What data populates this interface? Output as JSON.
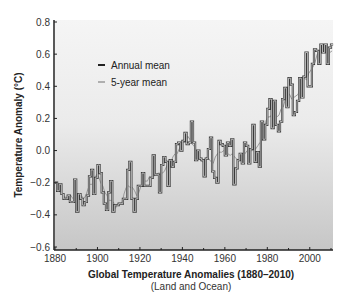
{
  "chart_data": {
    "type": "line",
    "title": "Global Temperature Anomalies (1880–2010)",
    "subtitle": "(Land and Ocean)",
    "xlabel": "Global Temperature Anomalies (1880–2010)",
    "ylabel": "Temperature Anomaly (°C)",
    "xlim": [
      1880,
      2010
    ],
    "ylim": [
      -0.6,
      0.8
    ],
    "x_ticks": [
      1880,
      1900,
      1920,
      1940,
      1960,
      1980,
      2000
    ],
    "x_minor_ticks": [
      1890,
      1910,
      1930,
      1950,
      1970,
      1990,
      2010
    ],
    "y_ticks": [
      -0.6,
      -0.4,
      -0.2,
      0.0,
      0.2,
      0.4,
      0.6,
      0.8
    ],
    "y_tick_labels": [
      "−0.6",
      "−0.4",
      "−0.2",
      "0.0",
      "0.2",
      "0.4",
      "0.6",
      "0.8"
    ],
    "grid": false,
    "legend_position": "upper-left",
    "legend": [
      "Annual mean",
      "5-year mean"
    ],
    "x_start": 1880,
    "series": [
      {
        "name": "Annual mean",
        "style": "step",
        "color": "#3a3a3a",
        "values": [
          -0.2,
          -0.25,
          -0.21,
          -0.27,
          -0.3,
          -0.3,
          -0.28,
          -0.32,
          -0.32,
          -0.18,
          -0.38,
          -0.27,
          -0.3,
          -0.34,
          -0.32,
          -0.28,
          -0.16,
          -0.12,
          -0.27,
          -0.17,
          -0.09,
          -0.14,
          -0.26,
          -0.33,
          -0.37,
          -0.26,
          -0.19,
          -0.38,
          -0.34,
          -0.34,
          -0.33,
          -0.33,
          -0.3,
          -0.3,
          -0.12,
          -0.07,
          -0.3,
          -0.38,
          -0.3,
          -0.22,
          -0.22,
          -0.14,
          -0.22,
          -0.22,
          -0.22,
          -0.17,
          -0.03,
          -0.15,
          -0.15,
          -0.26,
          -0.09,
          -0.04,
          -0.07,
          -0.22,
          -0.06,
          -0.1,
          -0.07,
          0.04,
          0.05,
          0.0,
          0.06,
          0.11,
          0.04,
          0.05,
          0.18,
          0.05,
          -0.06,
          0.0,
          -0.05,
          -0.06,
          -0.16,
          -0.05,
          0.01,
          0.08,
          -0.13,
          -0.17,
          -0.2,
          0.06,
          0.04,
          0.03,
          -0.03,
          0.05,
          0.03,
          0.07,
          -0.21,
          -0.11,
          -0.06,
          -0.02,
          -0.08,
          0.05,
          0.03,
          -0.08,
          0.01,
          0.16,
          -0.07,
          -0.01,
          -0.1,
          0.18,
          0.07,
          0.16,
          0.26,
          0.32,
          0.14,
          0.31,
          0.16,
          0.12,
          0.18,
          0.32,
          0.39,
          0.27,
          0.45,
          0.41,
          0.22,
          0.24,
          0.31,
          0.45,
          0.33,
          0.46,
          0.61,
          0.4,
          0.4,
          0.54,
          0.63,
          0.62,
          0.54,
          0.68,
          0.61,
          0.66,
          0.54,
          0.64,
          0.71
        ],
        "values_note": "Estimated from pixel positions; the rendered plot clips at the visible maximum (~0.64)."
      },
      {
        "name": "5-year mean",
        "style": "line",
        "color": "#9a9a9a",
        "values": [
          -0.23,
          -0.24,
          -0.26,
          -0.27,
          -0.29,
          -0.29,
          -0.3,
          -0.28,
          -0.3,
          -0.3,
          -0.29,
          -0.3,
          -0.28,
          -0.3,
          -0.28,
          -0.24,
          -0.21,
          -0.21,
          -0.19,
          -0.15,
          -0.16,
          -0.2,
          -0.22,
          -0.26,
          -0.28,
          -0.31,
          -0.31,
          -0.32,
          -0.36,
          -0.33,
          -0.33,
          -0.33,
          -0.27,
          -0.23,
          -0.22,
          -0.23,
          -0.23,
          -0.25,
          -0.28,
          -0.26,
          -0.22,
          -0.2,
          -0.19,
          -0.19,
          -0.16,
          -0.17,
          -0.16,
          -0.15,
          -0.14,
          -0.14,
          -0.14,
          -0.13,
          -0.1,
          -0.08,
          -0.08,
          -0.04,
          -0.02,
          -0.02,
          0.01,
          0.04,
          0.05,
          0.05,
          0.09,
          0.07,
          0.04,
          0.03,
          -0.01,
          -0.02,
          -0.06,
          -0.07,
          -0.06,
          -0.04,
          -0.05,
          -0.07,
          -0.08,
          -0.04,
          -0.02,
          -0.01,
          -0.01,
          0.0,
          -0.02,
          -0.02,
          -0.03,
          -0.02,
          -0.04,
          -0.05,
          -0.06,
          -0.04,
          -0.02,
          -0.02,
          0.0,
          0.01,
          0.0,
          0.0,
          0.01,
          0.03,
          0.05,
          0.06,
          0.13,
          0.19,
          0.21,
          0.21,
          0.24,
          0.21,
          0.21,
          0.22,
          0.26,
          0.27,
          0.32,
          0.36,
          0.35,
          0.32,
          0.33,
          0.34,
          0.35,
          0.39,
          0.43,
          0.45,
          0.44,
          0.48,
          0.5,
          0.52,
          0.55,
          0.6,
          0.61,
          0.61,
          0.61,
          0.62,
          0.61,
          0.61,
          0.62
        ]
      }
    ]
  },
  "figure": {
    "title": "Global Temperature Anomalies (1880–2010)",
    "subtitle": "(Land and Ocean)",
    "ylabel": "Temperature Anomaly (°C)",
    "legend": {
      "annual": "Annual mean",
      "five_year": "5-year mean"
    },
    "colors": {
      "annual": "#3a3a3a",
      "five_year": "#9a9a9a",
      "plot_bg_top": "#f4f4f4",
      "plot_bg_bottom": "#c8c8c8",
      "axis": "#222222"
    }
  }
}
